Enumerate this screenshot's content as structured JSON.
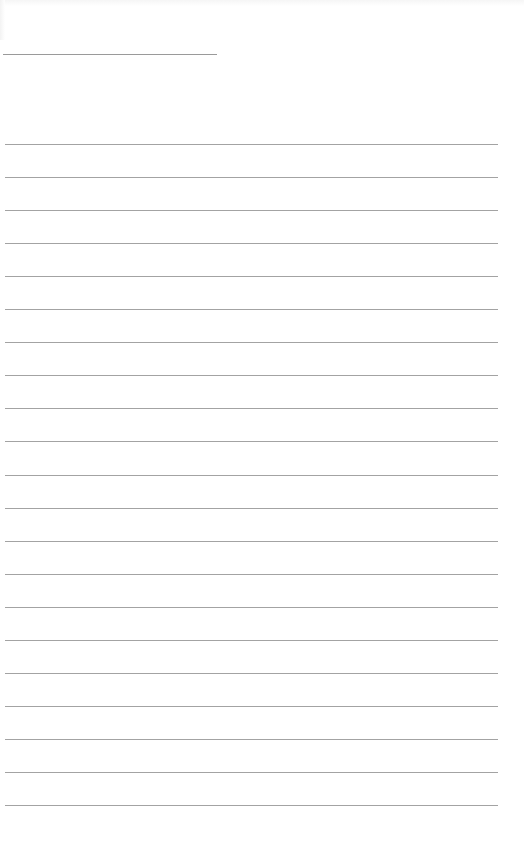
{
  "document": {
    "type": "blank lined page",
    "header_rule": {
      "x": 3,
      "y": 54,
      "width": 214
    },
    "ruled_lines": {
      "count": 21,
      "first_y": 144,
      "spacing": 33.05,
      "x": 5,
      "width": 493
    },
    "colors": {
      "background": "#ffffff",
      "rule": "#a3a3a3",
      "header_rule": "#9a9a9a"
    }
  }
}
